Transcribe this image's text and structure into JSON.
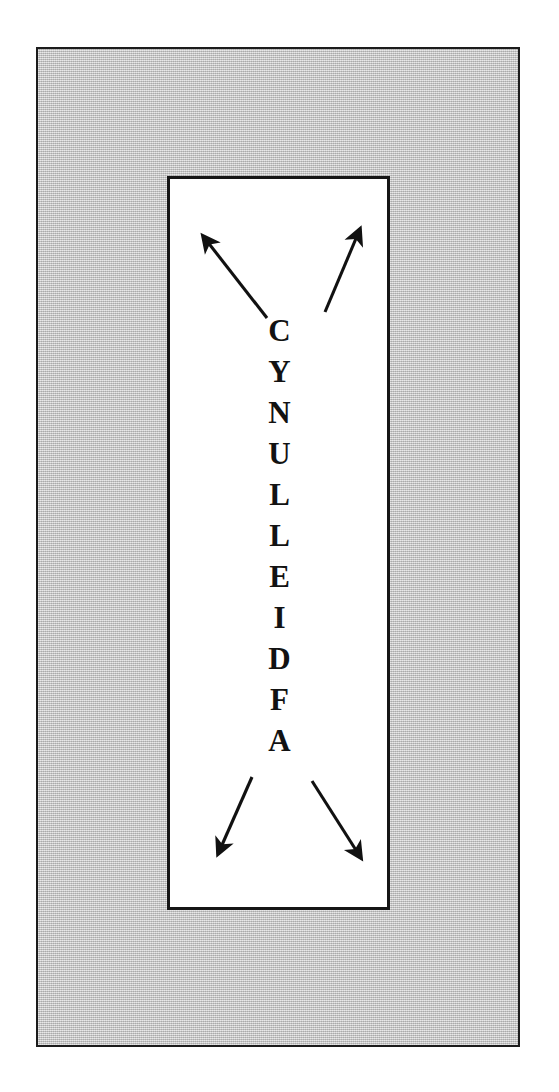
{
  "page": {
    "background_color": "#ffffff",
    "width": 559,
    "height": 1092
  },
  "outer_frame": {
    "name": "outer-gray-panel",
    "fill_color": "#c4c4c4",
    "border_color": "#1c1c1c",
    "texture": "dithered-halftone-gray"
  },
  "inner_box": {
    "name": "inner-white-diagram-box",
    "fill_color": "#ffffff",
    "border_color": "#151515"
  },
  "diagram": {
    "word": "CYNULLEIDFA",
    "orientation": "vertical",
    "text_color": "#121212",
    "letters": [
      {
        "char": "C"
      },
      {
        "char": "Y"
      },
      {
        "char": "N"
      },
      {
        "char": "U"
      },
      {
        "char": "L"
      },
      {
        "char": "L"
      },
      {
        "char": "E"
      },
      {
        "char": "I"
      },
      {
        "char": "D"
      },
      {
        "char": "F"
      },
      {
        "char": "A"
      }
    ],
    "arrows": [
      {
        "id": "arrow-top-left",
        "direction": "up-left",
        "color": "#111111",
        "x1": 97,
        "y1": 139,
        "x2": 26,
        "y2": 48
      },
      {
        "id": "arrow-top-right",
        "direction": "up-right",
        "color": "#111111",
        "x1": 155,
        "y1": 133,
        "x2": 196,
        "y2": 41
      },
      {
        "id": "arrow-bottom-left",
        "direction": "down-left",
        "color": "#111111",
        "x1": 82,
        "y1": 598,
        "x2": 42,
        "y2": 684
      },
      {
        "id": "arrow-bottom-right",
        "direction": "down-right",
        "color": "#111111",
        "x1": 142,
        "y1": 602,
        "x2": 197,
        "y2": 688
      }
    ]
  }
}
